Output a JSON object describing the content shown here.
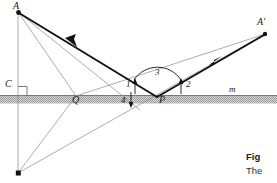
{
  "figure": {
    "type": "geometry-optics-reflection-diagram",
    "surface_label": "m",
    "points": [
      {
        "id": "A",
        "label": "A",
        "x": 18,
        "y": 12,
        "label_x": 15,
        "label_y": 2,
        "dot": true
      },
      {
        "id": "Aprime",
        "label": "A'",
        "x": 265,
        "y": 34,
        "label_x": 259,
        "label_y": 19,
        "dot": true
      },
      {
        "id": "C",
        "label": "C",
        "x": 18,
        "y": 95,
        "label_x": 6,
        "label_y": 80,
        "dot": false
      },
      {
        "id": "Q",
        "label": "Q",
        "x": 76,
        "y": 96,
        "label_x": 73,
        "label_y": 97,
        "dot": false
      },
      {
        "id": "P",
        "label": "P",
        "x": 157,
        "y": 97,
        "label_x": 159,
        "label_y": 97,
        "dot": false
      },
      {
        "id": "Aimage",
        "label": "",
        "x": 18,
        "y": 173,
        "label_x": 0,
        "label_y": 0,
        "dot": true
      }
    ],
    "angle_labels": [
      {
        "id": "angle-1",
        "label": "1",
        "x": 126,
        "y": 84
      },
      {
        "id": "angle-2",
        "label": "2",
        "x": 186,
        "y": 84
      },
      {
        "id": "angle-3",
        "label": "3",
        "x": 155,
        "y": 70
      },
      {
        "id": "angle-4",
        "label": "4",
        "x": 122,
        "y": 99
      }
    ],
    "surface": {
      "label": "m",
      "label_x": 229,
      "label_y": 86,
      "line_y": 95,
      "hatch_top": 96,
      "hatch_bottom": 103,
      "x_start": 0,
      "x_end": 277
    },
    "colors": {
      "ray_bold": "#111111",
      "ray_thin": "#8a8a8a",
      "surface_line": "#555555",
      "hatch_fill": "#c9c9c9",
      "text": "#1a1a1a"
    },
    "strokes": {
      "bold_width": 1.9,
      "thin_width": 0.7
    }
  },
  "caption": {
    "title": "Fig",
    "body": "The"
  }
}
